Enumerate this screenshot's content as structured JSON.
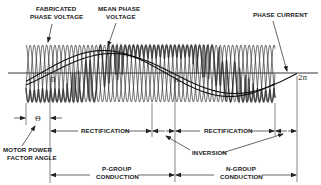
{
  "diagram": {
    "type": "cycloconverter-waveform",
    "labels": {
      "fabricated_line1": "FABRICATED",
      "fabricated_line2": "PHASE VOLTAGE",
      "mean_line1": "MEAN PHASE",
      "mean_line2": "VOLTAGE",
      "phase_current": "PHASE CURRENT",
      "motor_line1": "MOTOR POWER",
      "motor_line2": "FACTOR ANGLE",
      "rectification_1": "RECTIFICATION",
      "rectification_2": "RECTIFICATION",
      "inversion": "INVERSION",
      "pgroup_line1": "P-GROUP",
      "pgroup_line2": "CONDUCTION",
      "ngroup_line1": "N-GROUP",
      "ngroup_line2": "CONDUCTION"
    },
    "axis_marks": {
      "zero": "0",
      "pi": "π",
      "two_pi": "2π",
      "theta": "Θ"
    },
    "colors": {
      "ink": "#222222",
      "background": "#ffffff"
    }
  }
}
